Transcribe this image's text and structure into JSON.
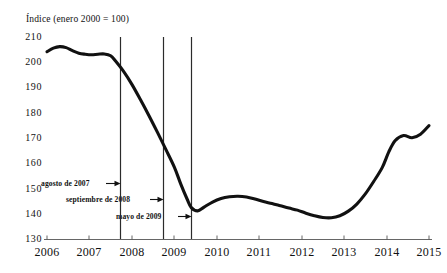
{
  "figure": {
    "axis_title": "Índice (enero 2000 = 100)",
    "line_color": "#111111",
    "rule_color": "#2b2b2b",
    "axis_color": "#555555",
    "background": "#ffffff"
  },
  "chart_data": {
    "type": "line",
    "title": "",
    "subtitle": "",
    "xlabel": "",
    "ylabel": "Índice (enero 2000 = 100)",
    "xlim": [
      2006,
      2015
    ],
    "ylim": [
      130,
      210
    ],
    "grid": false,
    "legend": "none",
    "y_ticks": [
      210,
      200,
      190,
      180,
      170,
      160,
      150,
      140,
      130
    ],
    "x_ticks": [
      "2006",
      "2007",
      "2008",
      "2009",
      "2010",
      "2011",
      "2012",
      "2013",
      "2014",
      "2015"
    ],
    "series": [
      {
        "name": "Índice",
        "x": [
          2006.0,
          2006.15,
          2006.3,
          2006.45,
          2006.6,
          2006.75,
          2006.9,
          2007.05,
          2007.2,
          2007.35,
          2007.5,
          2007.62,
          2007.8,
          2008.0,
          2008.2,
          2008.4,
          2008.6,
          2008.8,
          2009.0,
          2009.15,
          2009.3,
          2009.4,
          2009.55,
          2009.7,
          2009.9,
          2010.1,
          2010.3,
          2010.5,
          2010.7,
          2010.9,
          2011.1,
          2011.3,
          2011.5,
          2011.7,
          2011.9,
          2012.1,
          2012.3,
          2012.5,
          2012.7,
          2012.9,
          2013.1,
          2013.3,
          2013.5,
          2013.7,
          2013.9,
          2014.05,
          2014.2,
          2014.4,
          2014.6,
          2014.8,
          2015.0
        ],
        "y": [
          204.2,
          205.6,
          206.2,
          205.8,
          204.6,
          203.6,
          203.2,
          203.0,
          203.2,
          203.3,
          202.6,
          200.4,
          196.5,
          191.3,
          185.3,
          179.0,
          172.4,
          165.6,
          158.6,
          152.0,
          146.0,
          142.6,
          141.3,
          142.8,
          144.8,
          146.2,
          146.9,
          147.1,
          146.8,
          146.0,
          145.0,
          144.2,
          143.3,
          142.4,
          141.6,
          140.4,
          139.4,
          138.7,
          138.6,
          139.4,
          141.2,
          144.0,
          148.0,
          153.0,
          158.5,
          164.5,
          169.0,
          171.1,
          170.2,
          171.6,
          175.0
        ]
      }
    ],
    "annotations": [
      {
        "id": "agosto-2007",
        "label": "agosto de 2007",
        "x_value": 2007.62,
        "label_y": 150
      },
      {
        "id": "septiembre-2008",
        "label": "septiembre de 2008",
        "x_value": 2008.67,
        "label_y": 144.5
      },
      {
        "id": "mayo-2009",
        "label": "mayo de 2009",
        "x_value": 2009.33,
        "label_y": 138.5
      }
    ]
  }
}
